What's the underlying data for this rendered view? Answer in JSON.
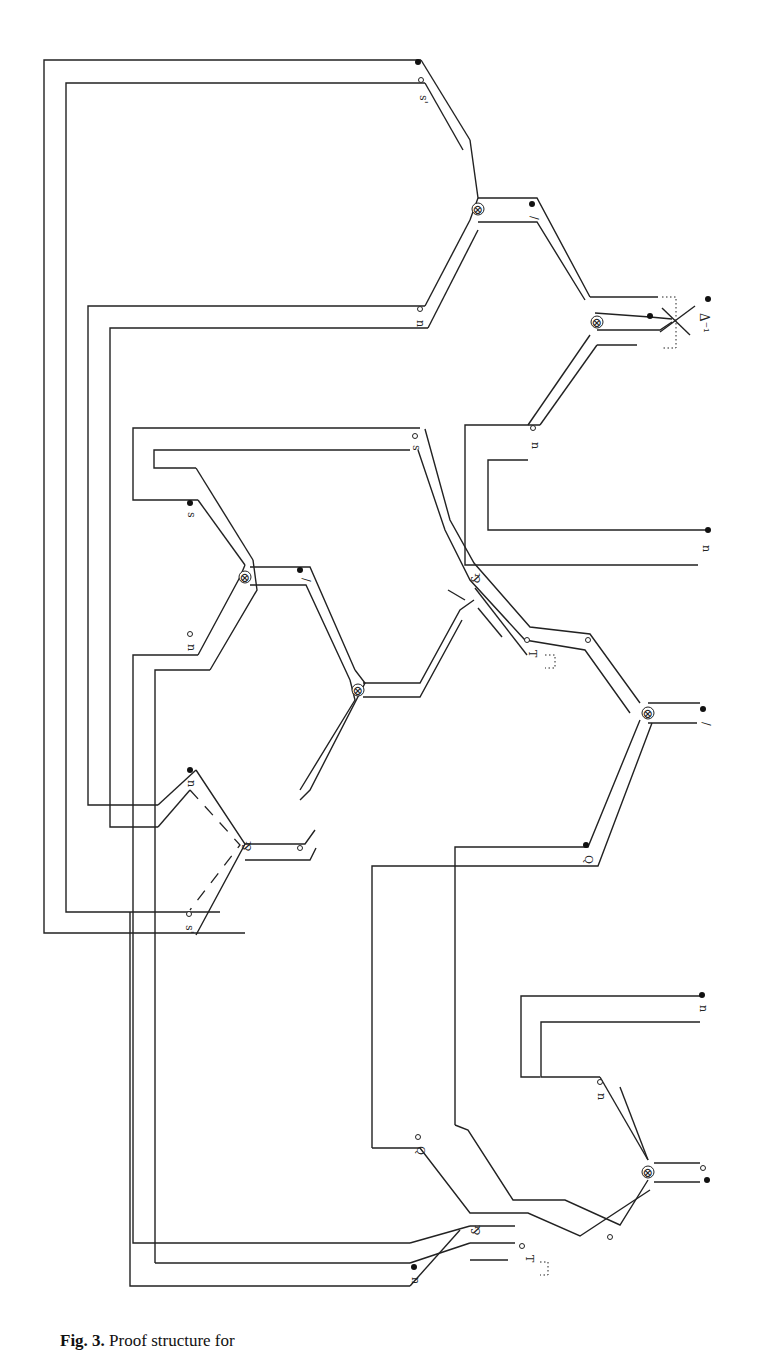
{
  "figure": {
    "type": "proof-structure diagram (rotated 90°)",
    "caption_label": "Fig. 3.",
    "caption_text": "Proof structure for",
    "caption_note": "caption is clipped at the bottom edge; only the tops of the glyphs are visible"
  },
  "nodes": [
    {
      "id": "tensor-top-right",
      "symbol": "⊗",
      "x": 597,
      "y": 212
    },
    {
      "id": "tensor-top-mid",
      "symbol": "⊗",
      "x": 478,
      "y": 103
    },
    {
      "id": "tensor-mid-upper",
      "symbol": "⊗",
      "x": 245,
      "y": 577
    },
    {
      "id": "tensor-mid-center",
      "symbol": "⊗",
      "x": 358,
      "y": 683
    },
    {
      "id": "par-mid-lower",
      "symbol": "⅋",
      "x": 245,
      "y": 844
    },
    {
      "id": "par-mid-center",
      "symbol": "⅋",
      "x": 474,
      "y": 576
    },
    {
      "id": "tensor-mid-right",
      "symbol": "⊗",
      "x": 648,
      "y": 713
    },
    {
      "id": "tensor-bottom-right",
      "symbol": "⊗",
      "x": 648,
      "y": 1173
    },
    {
      "id": "par-bottom",
      "symbol": "⅋",
      "x": 474,
      "y": 1230
    }
  ],
  "labels": {
    "top_s_prime": "s'",
    "top_n": "n",
    "top_slash": "/",
    "top_right_delta_inv": "Δ⁻¹",
    "top_right_n": "n",
    "mid_s": "s",
    "mid_n": "n",
    "mid_slash": "/",
    "mid_n2": "n",
    "mid_s_prime": "s'",
    "mid_par_symbol": "⅋",
    "center_s": "s",
    "center_par_symbol": "⅋",
    "center_T": "T",
    "right_slash": "/",
    "right_q": "Q",
    "bottom_q": "Q",
    "bottom_n_inner": "n",
    "bottom_par_symbol": "⅋",
    "bottom_T": "T",
    "bottom_n_left": "n",
    "bottom_right_n": "n",
    "tensor": "⊗"
  },
  "colors": {
    "line": "#222222",
    "background": "#ffffff"
  }
}
